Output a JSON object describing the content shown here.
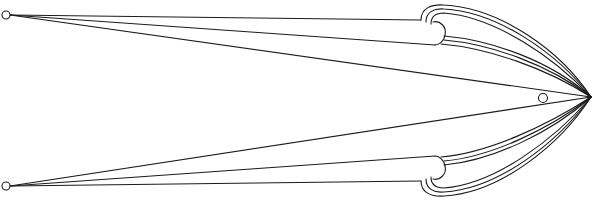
{
  "diagram": {
    "type": "line-drawing",
    "stroke_color": "#1a1a1a",
    "background": "#ffffff",
    "apex": {
      "x": 591,
      "y": 97
    },
    "nodes": [
      {
        "id": "top-left-node",
        "x": 6,
        "y": 15,
        "r": 4
      },
      {
        "id": "bottom-left-node",
        "x": 6,
        "y": 186,
        "r": 4
      },
      {
        "id": "inner-node",
        "x": 543,
        "y": 98,
        "r": 4.5
      }
    ],
    "curls": [
      {
        "id": "top-curl",
        "center": {
          "x": 438,
          "y": 28
        }
      },
      {
        "id": "bottom-curl",
        "center": {
          "x": 438,
          "y": 172
        }
      }
    ]
  }
}
